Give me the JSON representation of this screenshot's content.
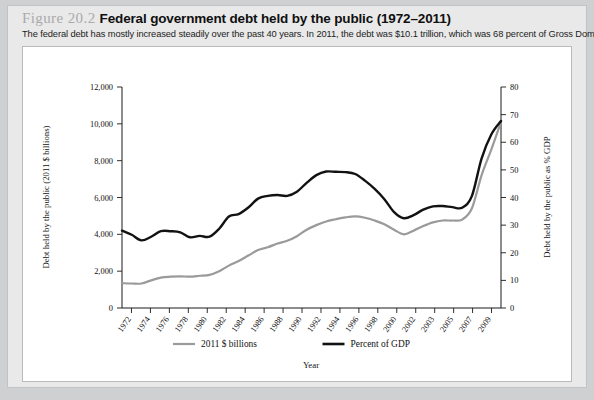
{
  "figure": {
    "label": "Figure 20.2",
    "title": "Federal government debt held by the public (1972–2011)",
    "subtitle": "The federal debt has mostly increased steadily over the past 40 years. In 2011, the debt was $10.1 trillion, which was 68 percent of Gross Domestic Product."
  },
  "colors": {
    "billions_series": "#9a9a9a",
    "gdp_series": "#121212",
    "page_background": "#cfd0d2",
    "card_background": "#e9e9e9",
    "plot_background": "#ffffff"
  },
  "chart_data": {
    "type": "line",
    "title": "Federal government debt held by the public (1972–2011)",
    "xlabel": "Year",
    "ylabel": "Debt held by the public (2011 $ billions)",
    "y2label": "Debt held by the public as % GDP",
    "xlim": [
      1972,
      2011
    ],
    "ylim": [
      0,
      12000
    ],
    "y2lim": [
      0,
      80
    ],
    "yticks": [
      0,
      2000,
      4000,
      6000,
      8000,
      10000,
      12000
    ],
    "ytick_labels": [
      "0",
      "2,000",
      "4,000",
      "6,000",
      "8,000",
      "10,000",
      "12,000"
    ],
    "y2ticks": [
      0,
      10,
      20,
      30,
      40,
      50,
      60,
      70,
      80
    ],
    "y2tick_labels": [
      "0",
      "10",
      "20",
      "30",
      "40",
      "50",
      "60",
      "70",
      "80"
    ],
    "xticks": [
      1972,
      1974,
      1976,
      1978,
      1980,
      1982,
      1984,
      1986,
      1988,
      1990,
      1992,
      1994,
      1996,
      1998,
      2000,
      2002,
      2003,
      2005,
      2007,
      2009
    ],
    "xtick_labels": [
      "1972",
      "1974",
      "1976",
      "1978",
      "1980",
      "1982",
      "1984",
      "1986",
      "1988",
      "1990",
      "1992",
      "1994",
      "1996",
      "1998",
      "2000",
      "2002",
      "2003",
      "2005",
      "2007",
      "2009"
    ],
    "grid": false,
    "legend_position": "bottom",
    "x": [
      1972,
      1973,
      1974,
      1975,
      1976,
      1977,
      1978,
      1979,
      1980,
      1981,
      1982,
      1983,
      1984,
      1985,
      1986,
      1987,
      1988,
      1989,
      1990,
      1991,
      1992,
      1993,
      1994,
      1995,
      1996,
      1997,
      1998,
      1999,
      2000,
      2001,
      2002,
      2003,
      2004,
      2005,
      2006,
      2007,
      2008,
      2009,
      2010,
      2011
    ],
    "series": [
      {
        "name": "2011 $ billions",
        "axis": "left",
        "color": "#9a9a9a",
        "values": [
          1350,
          1330,
          1330,
          1500,
          1650,
          1700,
          1720,
          1700,
          1750,
          1800,
          2000,
          2300,
          2550,
          2850,
          3150,
          3300,
          3500,
          3650,
          3900,
          4250,
          4500,
          4700,
          4820,
          4920,
          4970,
          4900,
          4750,
          4550,
          4250,
          4000,
          4200,
          4450,
          4650,
          4750,
          4750,
          4800,
          5400,
          7200,
          8600,
          10100
        ]
      },
      {
        "name": "Percent of GDP",
        "axis": "right",
        "color": "#121212",
        "values": [
          28.0,
          26.5,
          24.5,
          25.8,
          27.8,
          27.8,
          27.4,
          25.6,
          26.1,
          25.8,
          28.7,
          33.1,
          34.0,
          36.4,
          39.6,
          40.6,
          40.9,
          40.6,
          42.1,
          45.3,
          48.1,
          49.4,
          49.3,
          49.2,
          48.5,
          46.1,
          43.1,
          39.4,
          34.7,
          32.5,
          33.6,
          35.6,
          36.8,
          36.9,
          36.5,
          36.3,
          40.5,
          54.1,
          62.8,
          67.7
        ]
      }
    ],
    "legend": [
      {
        "label": "2011 $ billions",
        "color": "#9a9a9a"
      },
      {
        "label": "Percent of GDP",
        "color": "#121212"
      }
    ]
  }
}
